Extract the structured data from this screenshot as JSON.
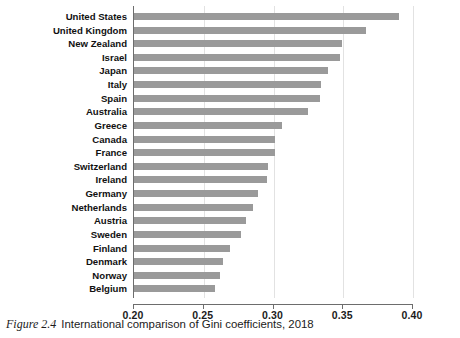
{
  "caption": {
    "figure_number": "Figure 2.4",
    "text": "International comparison of Gini coefficients, 2018"
  },
  "chart_data": {
    "type": "bar",
    "orientation": "horizontal",
    "title": "",
    "xlabel": "",
    "ylabel": "",
    "xlim": [
      0.2,
      0.4
    ],
    "xticks": [
      "0.20",
      "0.25",
      "0.30",
      "0.35",
      "0.40"
    ],
    "xtick_values": [
      0.2,
      0.25,
      0.3,
      0.35,
      0.4
    ],
    "grid": true,
    "grid_axis": "x",
    "legend": "none",
    "bar_color": "#9a9a9a",
    "categories": [
      "United States",
      "United Kingdom",
      "New Zealand",
      "Israel",
      "Japan",
      "Italy",
      "Spain",
      "Australia",
      "Greece",
      "Canada",
      "France",
      "Switzerland",
      "Ireland",
      "Germany",
      "Netherlands",
      "Austria",
      "Sweden",
      "Finland",
      "Denmark",
      "Norway",
      "Belgium"
    ],
    "values": [
      0.39,
      0.366,
      0.349,
      0.348,
      0.339,
      0.334,
      0.333,
      0.325,
      0.306,
      0.301,
      0.301,
      0.296,
      0.295,
      0.289,
      0.285,
      0.28,
      0.277,
      0.269,
      0.264,
      0.262,
      0.258
    ]
  }
}
